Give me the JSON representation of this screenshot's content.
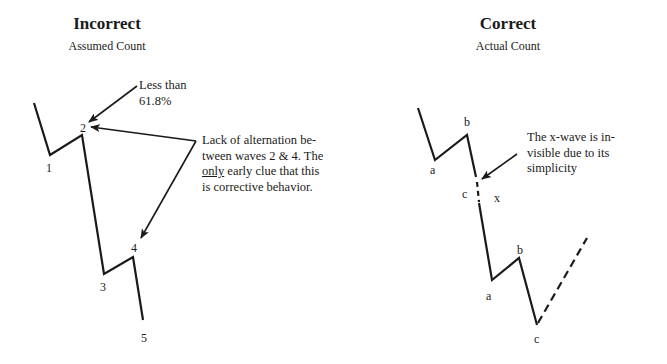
{
  "left_panel": {
    "title": "Incorrect",
    "subtitle": "Assumed Count",
    "wave_labels": [
      "1",
      "2",
      "3",
      "4",
      "5"
    ],
    "annotation_top": {
      "line1": "Less than",
      "line2": "61.8%"
    },
    "annotation_side": {
      "line1": "Lack of alternation be-",
      "line2": "tween waves 2 & 4.  The",
      "line3_underlined": "only",
      "line3_rest": " early clue that this",
      "line4": "is corrective behavior."
    }
  },
  "right_panel": {
    "title": "Correct",
    "subtitle": "Actual Count",
    "wave_labels": {
      "first_a": "a",
      "first_b": "b",
      "first_c": "c",
      "x": "x",
      "second_a": "a",
      "second_b": "b",
      "second_c": "c"
    },
    "annotation": {
      "line1": "The x-wave is in-",
      "line2": "visible due to its",
      "line3": "simplicity"
    }
  },
  "colors": {
    "line": "#1a1a1a",
    "background": "#ffffff"
  }
}
